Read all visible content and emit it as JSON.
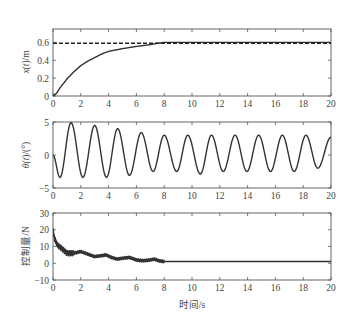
{
  "chart_data": [
    {
      "type": "line",
      "title": "",
      "xlabel": "",
      "ylabel": "x(t)/m",
      "xlim": [
        0,
        20
      ],
      "ylim": [
        0,
        0.75
      ],
      "xticks": [
        0,
        2,
        4,
        6,
        8,
        10,
        12,
        14,
        16,
        18,
        20
      ],
      "yticks": [
        0,
        0.2,
        0.4,
        0.6
      ],
      "ytick_labels": [
        "0",
        "0.2",
        "0.4",
        "0.6"
      ],
      "grid": false,
      "series": [
        {
          "name": "x(t)",
          "style": "solid",
          "x": [
            0,
            0.25,
            0.5,
            1,
            1.5,
            2,
            2.5,
            3,
            3.5,
            4,
            5,
            6,
            7,
            7.5,
            8,
            10,
            12,
            14,
            16,
            18,
            20
          ],
          "values": [
            0,
            0.03,
            0.09,
            0.19,
            0.27,
            0.34,
            0.39,
            0.43,
            0.47,
            0.5,
            0.53,
            0.555,
            0.575,
            0.59,
            0.6,
            0.6,
            0.6,
            0.6,
            0.6,
            0.6,
            0.6
          ]
        },
        {
          "name": "reference",
          "style": "dashed",
          "x": [
            0,
            20
          ],
          "values": [
            0.59,
            0.59
          ]
        }
      ]
    },
    {
      "type": "line",
      "title": "",
      "xlabel": "",
      "ylabel": "θ(t)/(°)",
      "xlim": [
        0,
        20
      ],
      "ylim": [
        -5,
        5
      ],
      "xticks": [
        0,
        2,
        4,
        6,
        8,
        10,
        12,
        14,
        16,
        18,
        20
      ],
      "yticks": [
        -5,
        0,
        5
      ],
      "ytick_labels": [
        "−5",
        "0",
        "5"
      ],
      "grid": false,
      "series": [
        {
          "name": "θ(t)",
          "style": "solid",
          "description": "oscillation with period ≈1.7 s",
          "peaks_t": [
            1.3,
            3.0,
            4.65,
            6.35,
            8.0,
            9.7,
            11.4,
            13.1,
            14.8,
            16.5,
            18.2
          ],
          "peaks": [
            4.9,
            4.5,
            4.0,
            3.4,
            3.0,
            3.0,
            3.0,
            3.0,
            3.0,
            3.0,
            3.0
          ],
          "troughs_t": [
            0.5,
            2.15,
            3.85,
            5.5,
            7.2,
            8.9,
            10.6,
            12.25,
            13.95,
            15.65,
            17.35,
            19.05
          ],
          "troughs": [
            -3.4,
            -3.4,
            -3.4,
            -3.1,
            -2.5,
            -2.5,
            -2.9,
            -2.5,
            -2.5,
            -2.5,
            -2.5,
            -2.0
          ],
          "start": 0,
          "end_t": 20,
          "end": 2.7
        }
      ]
    },
    {
      "type": "line",
      "title": "",
      "xlabel": "时间/s",
      "ylabel": "控制量/N",
      "xlim": [
        0,
        20
      ],
      "ylim": [
        -10,
        30
      ],
      "xticks": [
        0,
        2,
        4,
        6,
        8,
        10,
        12,
        14,
        16,
        18,
        20
      ],
      "yticks": [
        -10,
        0,
        10,
        20,
        30
      ],
      "ytick_labels": [
        "−10",
        "0",
        "10",
        "20",
        "30"
      ],
      "grid": false,
      "series": [
        {
          "name": "控制量",
          "style": "solid",
          "x": [
            0,
            0.1,
            0.3,
            0.6,
            1.0,
            1.5,
            2.0,
            2.5,
            3.0,
            3.5,
            3.8,
            4.2,
            4.6,
            5.0,
            5.5,
            6.0,
            6.5,
            7.0,
            7.3,
            7.6,
            8.0,
            10,
            12,
            14,
            16,
            18,
            20
          ],
          "values": [
            20,
            15,
            11,
            9,
            6,
            6,
            7,
            5.5,
            4,
            4.5,
            5,
            3.5,
            2.5,
            3,
            3.5,
            2,
            1.5,
            2,
            2.5,
            1.5,
            1,
            1,
            1,
            1,
            1,
            1,
            1
          ]
        }
      ]
    }
  ],
  "labels": {
    "top_ylabel_x": "x(",
    "top_ylabel_t": "t",
    "top_ylabel_rest": ")/m",
    "mid_ylabel_theta": "θ(",
    "mid_ylabel_t": "t",
    "mid_ylabel_rest": ")/(°)",
    "bot_ylabel": "控制量/N",
    "xlabel": "时间/s"
  }
}
